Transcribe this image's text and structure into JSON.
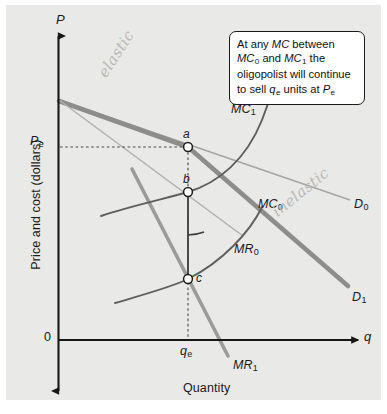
{
  "figure": {
    "background_color": "#e9e9e7",
    "ink_color": "#1a1a1a",
    "curve_gray": "#8d8d8d",
    "demand_gray": "#9a9a9a"
  },
  "axes": {
    "y_axis_title": "Price and cost (dollars)",
    "x_axis_title": "Quantity",
    "y_axis_symbol": "P",
    "x_axis_symbol": "q",
    "origin_label": "0",
    "y_tick_label": "P",
    "y_tick_sub": "e",
    "x_tick_label": "q",
    "x_tick_sub": "e"
  },
  "points": [
    {
      "id": "a",
      "label": "a",
      "x": 188,
      "y": 147
    },
    {
      "id": "b",
      "label": "b",
      "x": 188,
      "y": 192
    },
    {
      "id": "c",
      "label": "c",
      "x": 188,
      "y": 279
    }
  ],
  "curves": [
    {
      "name": "MC1",
      "label": "MC",
      "sub": "1",
      "type": "marginal-cost",
      "color": "#6f6f6f"
    },
    {
      "name": "MC0",
      "label": "MC",
      "sub": "0",
      "type": "marginal-cost",
      "color": "#6f6f6f"
    },
    {
      "name": "MR0",
      "label": "MR",
      "sub": "0",
      "type": "marginal-revenue",
      "color": "#8d8d8d"
    },
    {
      "name": "MR1",
      "label": "MR",
      "sub": "1",
      "type": "marginal-revenue",
      "color": "#8d8d8d"
    },
    {
      "name": "D0",
      "label": "D",
      "sub": "0",
      "type": "demand",
      "color": "#9a9a9a"
    },
    {
      "name": "D1",
      "label": "D",
      "sub": "1",
      "type": "demand",
      "color": "#8a8a8a"
    }
  ],
  "annotations": {
    "elastic": "elastic",
    "inelastic": "inelastic"
  },
  "callout": {
    "line1_a": "At any ",
    "line1_mc": "MC",
    "line1_b": " between ",
    "line1_mc0": "MC",
    "line1_mc0_sub": "0",
    "line2_a": "and ",
    "line2_mc1": "MC",
    "line2_mc1_sub": "1",
    "line2_b": " the oligopolist",
    "line3": "will continue to sell",
    "line4_q": "q",
    "line4_q_sub": "e",
    "line4_a": " units at ",
    "line4_p": "P",
    "line4_p_sub": "e"
  }
}
